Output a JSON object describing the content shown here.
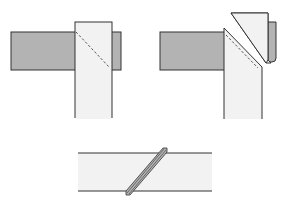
{
  "diagram": {
    "colors": {
      "dark_strip": "#b3b3b3",
      "light_strip": "#f2f2f2",
      "outline": "#333333",
      "dash": "#555555",
      "background": "#ffffff"
    },
    "steps": [
      {
        "id": "step-1",
        "description": "Vertical strip laid over horizontal strip with diagonal stitch line"
      },
      {
        "id": "step-2",
        "description": "Corner trimmed along diagonal and folded back"
      },
      {
        "id": "step-3",
        "description": "Joined strip with diagonal seam"
      }
    ]
  }
}
